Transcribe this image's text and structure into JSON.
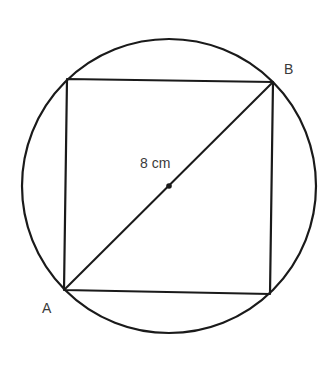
{
  "diagram": {
    "colors": {
      "stroke": "#1a1a1a",
      "label": "#3a3a3a",
      "background": "#ffffff"
    },
    "circle": {
      "cx": 169,
      "cy": 186,
      "r": 147
    },
    "square": {
      "corners": {
        "top_left": [
          67,
          79
        ],
        "top_right": [
          273,
          82
        ],
        "bottom_right": [
          270,
          294
        ],
        "bottom_left": [
          64,
          290
        ]
      }
    },
    "diagonal": {
      "from": "A",
      "to": "B"
    },
    "center_point": [
      169,
      186
    ],
    "labels": {
      "point_a": "A",
      "point_b": "B",
      "diagonal_length": "8 cm"
    }
  }
}
